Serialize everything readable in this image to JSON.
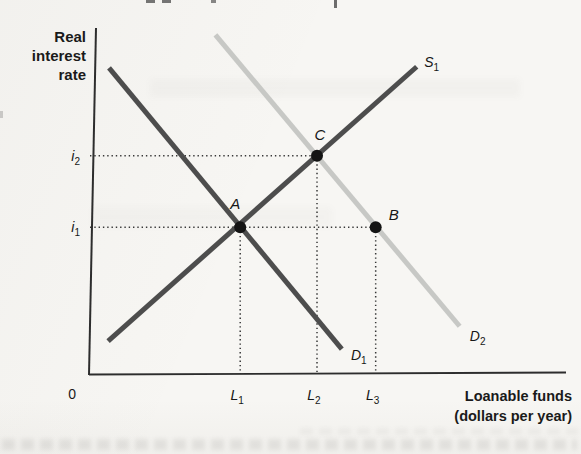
{
  "figure": {
    "y_axis_title": "Real\ninterest\nrate",
    "x_axis_title": "Loanable funds\n(dollars per year)",
    "origin_label": "0"
  },
  "chart_data": {
    "type": "line",
    "title": "",
    "xlabel": "Loanable funds (dollars per year)",
    "ylabel": "Real interest rate",
    "grid": false,
    "axes_quantitative": false,
    "axis_color": "#2d2d2d",
    "guide_color": "#383838",
    "point_color": "#141414",
    "curve_stroke_width": 5,
    "point_radius": 6,
    "series": [
      {
        "id": "S1",
        "label": {
          "main": "S",
          "sub": "1"
        },
        "role": "supply",
        "color": "#4d4d4d",
        "x1": 0.04,
        "y1": 0.095,
        "x2": 0.687,
        "y2": 0.888,
        "label_dx": 15,
        "label_dy": -5
      },
      {
        "id": "D1",
        "label": {
          "main": "D",
          "sub": "1"
        },
        "role": "demand-initial",
        "color": "#4d4d4d",
        "x1": 0.042,
        "y1": 0.885,
        "x2": 0.53,
        "y2": 0.072,
        "label_dx": 17,
        "label_dy": 6
      },
      {
        "id": "D2",
        "label": {
          "main": "D",
          "sub": "2"
        },
        "role": "demand-shifted",
        "color": "#c7c8c5",
        "x1": 0.265,
        "y1": 0.98,
        "x2": 0.777,
        "y2": 0.138,
        "label_dx": 18,
        "label_dy": 10
      }
    ],
    "points": [
      {
        "id": "A",
        "x": 0.317,
        "y": 0.424,
        "label_dx": -5,
        "label_dy": -24
      },
      {
        "id": "C",
        "x": 0.478,
        "y": 0.631,
        "label_dx": 3,
        "label_dy": -22
      },
      {
        "id": "B",
        "x": 0.601,
        "y": 0.424,
        "label_dx": 18,
        "label_dy": -13
      }
    ],
    "x_ticks": [
      {
        "id": "L1",
        "label": {
          "main": "L",
          "sub": "1"
        },
        "x": 0.317
      },
      {
        "id": "L2",
        "label": {
          "main": "L",
          "sub": "2"
        },
        "x": 0.478
      },
      {
        "id": "L3",
        "label": {
          "main": "L",
          "sub": "3"
        },
        "x": 0.601
      }
    ],
    "y_ticks": [
      {
        "id": "i2",
        "label": {
          "main": "i",
          "sub": "2"
        },
        "y": 0.631
      },
      {
        "id": "i1",
        "label": {
          "main": "i",
          "sub": "1"
        },
        "y": 0.424
      }
    ],
    "guides": [
      {
        "name": "i2-level",
        "orient": "h",
        "y": 0.631,
        "to_x": 0.478
      },
      {
        "name": "i1-level",
        "orient": "h",
        "y": 0.424,
        "to_x": 0.601
      },
      {
        "name": "L1-drop",
        "orient": "v",
        "x": 0.317,
        "from_y": 0.424
      },
      {
        "name": "L2-drop",
        "orient": "v",
        "x": 0.478,
        "from_y": 0.631
      },
      {
        "name": "L3-drop",
        "orient": "v",
        "x": 0.601,
        "from_y": 0.424
      }
    ]
  }
}
